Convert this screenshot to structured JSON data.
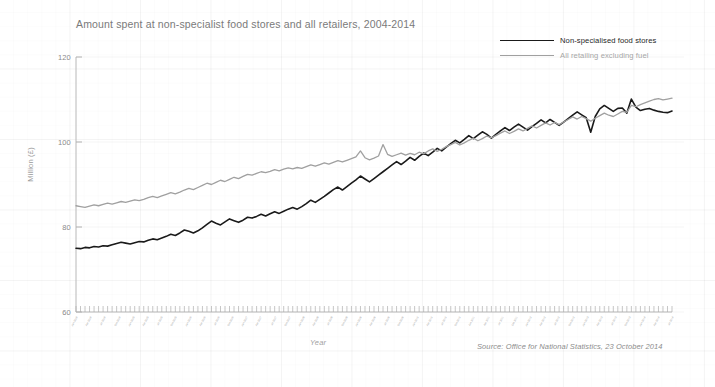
{
  "chart_data": {
    "type": "line",
    "title": "Amount spent at non-specialist food stores and all retailers, 2004-2014",
    "xlabel": "Year",
    "ylabel": "Million (£)",
    "ylim": [
      60,
      122
    ],
    "yticks": [
      60,
      80,
      100,
      120
    ],
    "ytick_labels": [
      "60",
      "80",
      "100",
      "120"
    ],
    "grid": true,
    "legend_position": "top-right",
    "source": "Source: Office for National Statistics, 23 October 2014",
    "x_range": [
      "Jan 2004",
      "Sep 2014"
    ],
    "x_tick_labels": [
      "Jan 2004",
      "Apr 2004",
      "Jul 2004",
      "Oct 2004",
      "Jan 2005",
      "Apr 2005",
      "Jul 2005",
      "Oct 2005",
      "Jan 2006",
      "Apr 2006",
      "Jul 2006",
      "Oct 2006",
      "Jan 2007",
      "Apr 2007",
      "Jul 2007",
      "Oct 2007",
      "Jan 2008",
      "Apr 2008",
      "Jul 2008",
      "Oct 2008",
      "Jan 2009",
      "Apr 2009",
      "Jul 2009",
      "Oct 2009",
      "Jan 2010",
      "Apr 2010",
      "Jul 2010",
      "Oct 2010",
      "Jan 2011",
      "Apr 2011",
      "Jul 2011",
      "Oct 2011",
      "Jan 2012",
      "Apr 2012",
      "Jul 2012",
      "Oct 2012",
      "Jan 2013",
      "Apr 2013",
      "Jul 2013",
      "Oct 2013",
      "Jan 2014",
      "Apr 2014",
      "Jul 2014"
    ],
    "series": [
      {
        "name": "Non-specialised food stores",
        "color": "#1a1a1a",
        "width": 1.6,
        "values": [
          75.0,
          74.9,
          75.2,
          75.1,
          75.4,
          75.3,
          75.6,
          75.5,
          75.8,
          76.1,
          76.4,
          76.2,
          76.0,
          76.3,
          76.6,
          76.5,
          76.9,
          77.2,
          77.0,
          77.4,
          77.8,
          78.3,
          78.0,
          78.6,
          79.3,
          79.0,
          78.6,
          79.1,
          79.8,
          80.6,
          81.4,
          80.9,
          80.5,
          81.2,
          81.9,
          81.5,
          81.1,
          81.6,
          82.3,
          82.1,
          82.5,
          83.0,
          82.6,
          83.1,
          83.6,
          83.2,
          83.7,
          84.2,
          84.6,
          84.2,
          84.8,
          85.5,
          86.3,
          85.8,
          86.5,
          87.2,
          88.0,
          88.8,
          89.4,
          88.7,
          89.5,
          90.3,
          91.1,
          92.0,
          91.3,
          90.6,
          91.4,
          92.2,
          93.0,
          93.8,
          94.6,
          95.4,
          94.7,
          95.5,
          96.4,
          95.7,
          96.6,
          97.4,
          96.8,
          97.6,
          98.5,
          97.9,
          98.8,
          99.6,
          100.4,
          99.8,
          100.6,
          101.5,
          100.8,
          101.6,
          102.4,
          101.8,
          100.9,
          101.8,
          102.6,
          103.4,
          102.7,
          103.5,
          104.2,
          103.5,
          102.8,
          103.6,
          104.4,
          105.2,
          104.5,
          105.3,
          104.6,
          103.9,
          104.7,
          105.5,
          106.3,
          107.1,
          106.4,
          105.7,
          102.3,
          106.0,
          107.8,
          108.6,
          107.9,
          107.2,
          107.9,
          108.0,
          106.8,
          110.1,
          108.2,
          107.4,
          107.7,
          107.9,
          107.5,
          107.2,
          107.0,
          106.9,
          107.3
        ]
      },
      {
        "name": "All retailing excluding fuel",
        "color": "#a0a0a0",
        "width": 1.3,
        "values": [
          85.0,
          84.8,
          84.6,
          84.9,
          85.2,
          85.0,
          85.3,
          85.6,
          85.4,
          85.7,
          86.0,
          85.8,
          86.1,
          86.4,
          86.2,
          86.5,
          86.9,
          87.2,
          86.9,
          87.3,
          87.7,
          88.1,
          87.8,
          88.2,
          88.7,
          89.1,
          88.8,
          89.3,
          89.8,
          90.3,
          90.0,
          90.5,
          91.0,
          90.7,
          91.2,
          91.7,
          91.4,
          91.9,
          92.4,
          92.2,
          92.6,
          93.0,
          92.8,
          93.1,
          93.5,
          93.2,
          93.6,
          93.9,
          93.7,
          94.0,
          93.8,
          94.2,
          94.6,
          94.3,
          94.7,
          95.1,
          94.8,
          95.2,
          95.6,
          95.3,
          95.7,
          96.1,
          96.5,
          97.9,
          96.3,
          95.8,
          96.2,
          96.7,
          99.4,
          97.1,
          96.6,
          97.0,
          97.4,
          96.9,
          97.3,
          97.0,
          97.6,
          97.2,
          97.9,
          98.4,
          97.8,
          98.3,
          98.9,
          99.4,
          99.9,
          99.3,
          99.8,
          100.4,
          100.9,
          100.3,
          100.8,
          101.4,
          101.0,
          101.5,
          102.1,
          102.6,
          102.0,
          102.5,
          103.1,
          102.6,
          103.2,
          103.8,
          103.3,
          103.9,
          104.5,
          104.0,
          104.6,
          104.1,
          104.7,
          105.3,
          105.9,
          105.4,
          106.0,
          105.5,
          104.9,
          105.6,
          106.2,
          106.8,
          106.3,
          106.0,
          106.6,
          107.2,
          107.0,
          108.6,
          108.3,
          108.8,
          109.2,
          109.6,
          110.0,
          110.2,
          109.9,
          110.1,
          110.3
        ]
      }
    ]
  }
}
